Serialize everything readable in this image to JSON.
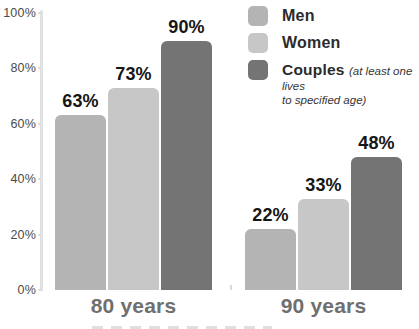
{
  "chart_data": {
    "type": "bar",
    "title": "",
    "categories": [
      "80 years",
      "90 years"
    ],
    "series": [
      {
        "name": "Men",
        "color": "#b4b4b4",
        "values": [
          63,
          22
        ],
        "labels": [
          "63%",
          "22%"
        ]
      },
      {
        "name": "Women",
        "color": "#c7c7c7",
        "values": [
          73,
          33
        ],
        "labels": [
          "73%",
          "33%"
        ]
      },
      {
        "name": "Couples",
        "color": "#747474",
        "values": [
          90,
          48
        ],
        "labels": [
          "90%",
          "48%"
        ]
      }
    ],
    "yticks": [
      "100%",
      "80%",
      "60%",
      "40%",
      "20%",
      "0%"
    ],
    "ylim": [
      0,
      100
    ],
    "grid": false,
    "legend_position": "top-right"
  },
  "legend": {
    "couples_note_line1": "(at least one lives",
    "couples_note_line2": "to specified age)"
  }
}
